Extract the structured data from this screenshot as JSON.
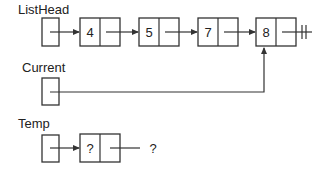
{
  "diagram": {
    "type": "linked-list",
    "pointers": [
      {
        "name": "ListHead",
        "label": "ListHead",
        "points_to": "node-4"
      },
      {
        "name": "Current",
        "label": "Current",
        "points_to": "node-8"
      },
      {
        "name": "Temp",
        "label": "Temp",
        "points_to": "temp-node"
      }
    ],
    "list_nodes": [
      {
        "value": "4"
      },
      {
        "value": "5"
      },
      {
        "value": "7"
      },
      {
        "value": "8"
      }
    ],
    "temp_node": {
      "value": "?",
      "next_label": "?"
    },
    "null_terminator": "ground-symbol"
  }
}
